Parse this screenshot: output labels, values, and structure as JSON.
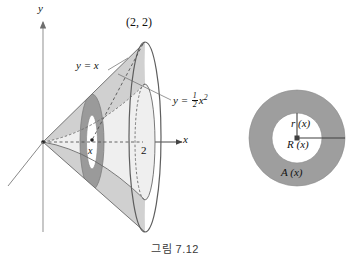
{
  "figure": {
    "caption": "그림 7.12",
    "caption_number": "7.12",
    "kind": "solid-of-revolution-washer-method"
  },
  "left_diagram": {
    "axes": {
      "y_axis_label": "y",
      "x_axis_label": "x"
    },
    "labels": {
      "intersection_point": "(2, 2)",
      "line_curve": "y = x",
      "parabola_curve_prefix": "y = ",
      "parabola_fraction_numerator": "1",
      "parabola_fraction_denominator": "2",
      "parabola_variable": "x",
      "parabola_exponent": "2",
      "x_tick_value": "2",
      "slice_position": "x"
    },
    "colors": {
      "light_fill": "#dcdcdc",
      "mid_fill": "#c9c9c9",
      "dark_fill": "#9e9e9e",
      "outline": "#555555",
      "axis": "#9a9a9a",
      "dashed": "#555555"
    }
  },
  "right_diagram": {
    "labels": {
      "inner_radius": "r (x)",
      "outer_radius": "R (x)",
      "area": "A (x)"
    },
    "colors": {
      "ring_fill": "#9e9e9e",
      "hole_fill": "#ffffff",
      "radius_line": "#4a4a4a"
    },
    "geometry": {
      "center_x": 297,
      "center_y": 138,
      "outer_radius": 48,
      "inner_radius": 25
    }
  }
}
